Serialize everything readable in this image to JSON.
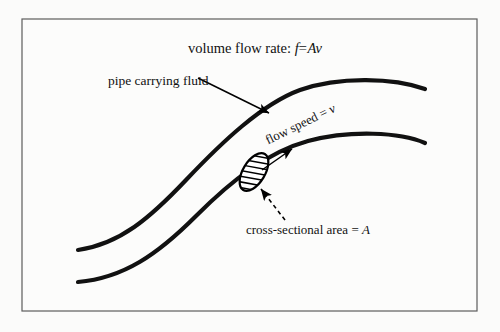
{
  "figure": {
    "kind": "physics-diagram",
    "background_color": "#fbfbfa",
    "ink_color": "#111111",
    "frame_color": "#5c5c5c"
  },
  "labels": {
    "title": {
      "text": "volume flow rate: f = Av",
      "prefix": "volume flow rate:",
      "symbol_f": "f",
      "equals": "=",
      "symbol_A": "A",
      "symbol_v": "v"
    },
    "pipe": {
      "text": "pipe carrying fluid"
    },
    "flow_speed": {
      "text": "flow speed = v",
      "prefix": "flow speed",
      "equals": "=",
      "symbol_v": "v"
    },
    "area": {
      "text": "cross-sectional area = A",
      "prefix": "cross-sectional area",
      "equals": "=",
      "symbol_A": "A"
    }
  },
  "geometry": {
    "frame": {
      "x": 22,
      "y": 19,
      "width": 455,
      "height": 292
    },
    "upper_wall_path": "M 78 250 C 120 244 150 218 186 180 C 222 142 262 104 300 90 C 340 76 394 78 425 89",
    "lower_wall_path": "M 78 282 C 124 278 158 254 196 216 C 232 180 268 152 308 141 C 350 130 400 132 425 143",
    "cross_section": {
      "center_x": 254,
      "center_y": 172,
      "radius_x": 11,
      "radius_y": 21,
      "rotation_deg": 31,
      "hatch_count": 7
    },
    "pipe_leader": {
      "x1": 198,
      "y1": 78,
      "x2": 269,
      "y2": 113
    },
    "flow_arrow": {
      "x1": 262,
      "y1": 170,
      "x2": 292,
      "y2": 149
    },
    "area_leader": {
      "x1": 285,
      "y1": 220,
      "x2": 261,
      "y2": 189
    }
  }
}
